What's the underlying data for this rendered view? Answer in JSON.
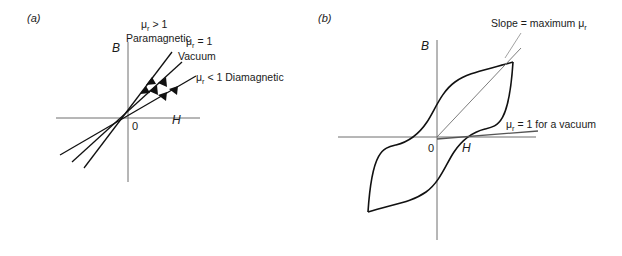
{
  "figure": {
    "background_color": "#ffffff",
    "ink_color": "#111111",
    "axis_color": "#6e6e6e"
  },
  "panels": [
    {
      "id": "a",
      "label": "(a)",
      "description": "B versus H straight-line plots for paramagnetic, vacuum and diamagnetic materials",
      "axes": {
        "y_label": "B",
        "x_label": "H",
        "origin_label": "0"
      },
      "annotations": [
        {
          "id": "paramagnetic",
          "line1": "μ",
          "sub": "r",
          "line1_rest": " > 1",
          "line2": "Paramagnetic"
        },
        {
          "id": "vacuum",
          "line1": "μ",
          "sub": "r",
          "line1_rest": " = 1",
          "line2": "Vacuum"
        },
        {
          "id": "diamagnetic",
          "line1": "μ",
          "sub": "r",
          "line1_rest": " < 1 Diamagnetic",
          "line2": ""
        }
      ],
      "series": [
        {
          "name": "paramagnetic",
          "relative_permeability": "> 1",
          "slope": "steepest"
        },
        {
          "name": "vacuum",
          "relative_permeability": "= 1",
          "slope": "medium"
        },
        {
          "name": "diamagnetic",
          "relative_permeability": "< 1",
          "slope": "shallowest"
        }
      ]
    },
    {
      "id": "b",
      "label": "(b)",
      "description": "B versus H hysteresis loop for a ferromagnetic material",
      "axes": {
        "y_label": "B",
        "x_label": "H",
        "origin_label": "0"
      },
      "annotations": [
        {
          "id": "max-slope",
          "text_before": "Slope = maximum μ",
          "sub": "r",
          "text_after": ""
        },
        {
          "id": "vacuum-slope",
          "text_before": "μ",
          "sub": "r",
          "text_after": " = 1 for a vacuum"
        }
      ]
    }
  ]
}
